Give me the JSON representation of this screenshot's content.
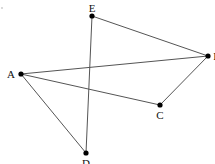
{
  "diagram": {
    "width": 215,
    "height": 164,
    "line_color": "#555555",
    "point_color": "#000000",
    "points": [
      {
        "id": "A",
        "label": "A",
        "x": 21,
        "y": 74,
        "lx": 11,
        "ly": 78,
        "anchor": "middle"
      },
      {
        "id": "B",
        "label": "B",
        "x": 208,
        "y": 56,
        "lx": 217,
        "ly": 60,
        "anchor": "middle"
      },
      {
        "id": "C",
        "label": "C",
        "x": 160,
        "y": 105,
        "lx": 160,
        "ly": 119,
        "anchor": "middle"
      },
      {
        "id": "D",
        "label": "D",
        "x": 86,
        "y": 153,
        "lx": 86,
        "ly": 167,
        "anchor": "middle"
      },
      {
        "id": "E",
        "label": "E",
        "x": 92,
        "y": 16,
        "lx": 92,
        "ly": 12,
        "anchor": "middle"
      }
    ],
    "segments": [
      [
        "E",
        "B"
      ],
      [
        "A",
        "B"
      ],
      [
        "A",
        "C"
      ],
      [
        "C",
        "B"
      ],
      [
        "A",
        "D"
      ],
      [
        "E",
        "D"
      ]
    ],
    "stray_mark": {
      "x": 2,
      "y": 8
    }
  }
}
